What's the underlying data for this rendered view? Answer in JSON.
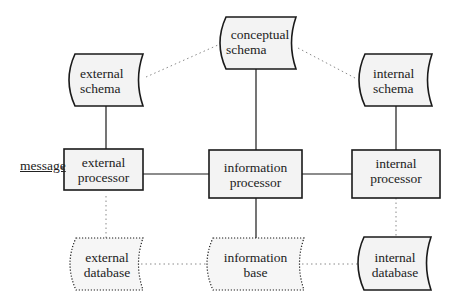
{
  "diagram": {
    "type": "three-schema architecture",
    "colors": {
      "stroke": "#1a1a1a",
      "fill": "#f3f3f3",
      "dotted": "#888888"
    },
    "input_label": "message",
    "nodes": {
      "conceptual_schema": {
        "line1": "conceptual",
        "line2": "schema",
        "shape": "stored-data",
        "style": "solid"
      },
      "external_schema": {
        "line1": "external",
        "line2": "schema",
        "shape": "stored-data",
        "style": "solid"
      },
      "internal_schema": {
        "line1": "internal",
        "line2": "schema",
        "shape": "stored-data",
        "style": "solid"
      },
      "external_processor": {
        "line1": "external",
        "line2": "processor",
        "shape": "rectangle",
        "style": "solid"
      },
      "information_processor": {
        "line1": "information",
        "line2": "processor",
        "shape": "rectangle",
        "style": "solid"
      },
      "internal_processor": {
        "line1": "internal",
        "line2": "processor",
        "shape": "rectangle",
        "style": "solid"
      },
      "external_database": {
        "line1": "external",
        "line2": "database",
        "shape": "stored-data",
        "style": "dotted"
      },
      "information_base": {
        "line1": "information",
        "line2": "base",
        "shape": "stored-data",
        "style": "dotted"
      },
      "internal_database": {
        "line1": "internal",
        "line2": "database",
        "shape": "stored-data",
        "style": "solid"
      }
    },
    "edges": [
      {
        "from": "external_schema",
        "to": "conceptual_schema",
        "style": "dotted"
      },
      {
        "from": "conceptual_schema",
        "to": "internal_schema",
        "style": "dotted"
      },
      {
        "from": "external_schema",
        "to": "external_processor",
        "style": "solid"
      },
      {
        "from": "conceptual_schema",
        "to": "information_processor",
        "style": "solid"
      },
      {
        "from": "internal_schema",
        "to": "internal_processor",
        "style": "solid"
      },
      {
        "from": "external_processor",
        "to": "information_processor",
        "style": "solid"
      },
      {
        "from": "information_processor",
        "to": "internal_processor",
        "style": "solid"
      },
      {
        "from": "external_processor",
        "to": "external_database",
        "style": "dotted"
      },
      {
        "from": "information_processor",
        "to": "information_base",
        "style": "solid"
      },
      {
        "from": "internal_processor",
        "to": "internal_database",
        "style": "dotted"
      },
      {
        "from": "external_database",
        "to": "information_base",
        "style": "dotted"
      },
      {
        "from": "information_base",
        "to": "internal_database",
        "style": "dotted"
      },
      {
        "from": "message",
        "to": "external_processor",
        "style": "solid"
      }
    ]
  }
}
